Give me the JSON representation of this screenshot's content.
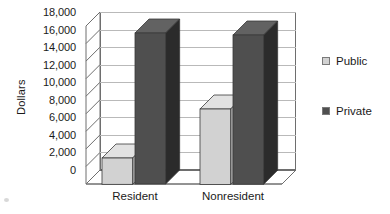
{
  "chart_data": {
    "type": "bar",
    "title": "",
    "subtitle": "",
    "xlabel": "",
    "ylabel": "Dollars",
    "categories": [
      "Resident",
      "Nonresident"
    ],
    "series": [
      {
        "name": "Public",
        "values": [
          3000,
          8600
        ],
        "color": "#d2d2d2"
      },
      {
        "name": "Private",
        "values": [
          17200,
          17000
        ],
        "color": "#4f4f4f"
      }
    ],
    "ylim": [
      0,
      18000
    ],
    "ytick_step": 2000,
    "ytick_labels": [
      "0",
      "2,000",
      "4,000",
      "6,000",
      "8,000",
      "10,000",
      "12,000",
      "14,000",
      "16,000",
      "18,000"
    ],
    "ytick_values": [
      0,
      2000,
      4000,
      6000,
      8000,
      10000,
      12000,
      14000,
      16000,
      18000
    ],
    "grid": true,
    "grid_axis": "y",
    "legend": true,
    "legend_position": "right",
    "three_d": true,
    "annotations": []
  },
  "legend": {
    "items": [
      {
        "label": "Public",
        "swatch_color": "#d2d2d2"
      },
      {
        "label": "Private",
        "swatch_color": "#4f4f4f"
      }
    ]
  },
  "axes": {
    "y_title": "Dollars",
    "x_categories": [
      "Resident",
      "Nonresident"
    ]
  },
  "colors": {
    "public_front": "#d2d2d2",
    "public_top": "#e2e2e2",
    "public_side": "#a9a9a9",
    "private_front": "#4f4f4f",
    "private_top": "#626262",
    "private_side": "#2b2b2b",
    "grid": "#b9b9b9",
    "frame": "#6e6e6e",
    "background": "#ffffff",
    "text": "#1a1a1a"
  }
}
